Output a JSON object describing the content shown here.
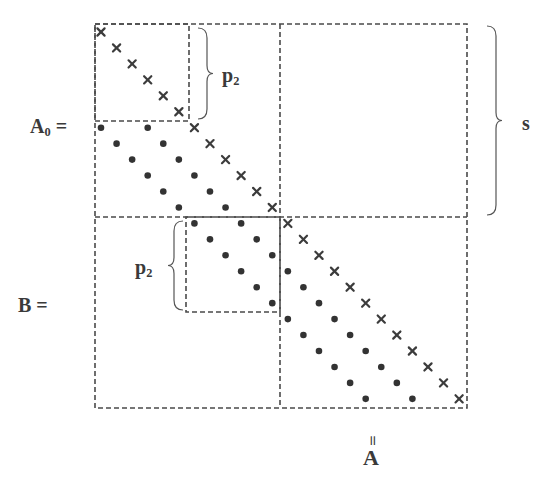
{
  "diagram": {
    "labels": {
      "A0_main": "A",
      "A0_sub": "0",
      "A0_eq": " =",
      "B": "B =",
      "s": "s",
      "p2_top_main": "p",
      "p2_top_sub": "2",
      "p2_bottom_main": "p",
      "p2_bottom_sub": "2",
      "eq_vertical": "॥",
      "A": "A"
    },
    "geometry": {
      "frame": {
        "x1": 95,
        "y1": 24,
        "x2": 467,
        "y2": 408
      },
      "h_divider_y": 217,
      "v_divider_x": 280,
      "top_left_box": {
        "x1": 95,
        "y1": 24,
        "x2": 189,
        "y2": 121
      },
      "inner_lower_box": {
        "x1": 186,
        "y1": 217,
        "x2": 280,
        "y2": 312
      },
      "diag_start": {
        "x": 101,
        "y": 32
      },
      "diag_step": {
        "dx": 15.57,
        "dy": 15.95
      },
      "n": 24,
      "brace_p2_top": {
        "x": 198,
        "y1": 28,
        "y2": 119
      },
      "brace_s": {
        "x": 487,
        "y1": 26,
        "y2": 215
      },
      "brace_p2_bottom": {
        "x": 183,
        "y1": 221,
        "y2": 310
      }
    },
    "elements": {
      "diagonal_marker": "cross",
      "subdiagonal_marker": "dot",
      "subdiagonal_offsets": [
        6,
        3
      ],
      "subdiagonal_start_row": 6
    },
    "colors": {
      "ink": "#3a3a3a",
      "background": "#ffffff"
    }
  }
}
